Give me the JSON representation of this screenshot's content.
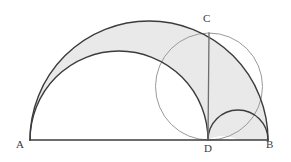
{
  "figure": {
    "name": "arbelos-construction",
    "canvas": {
      "width": 291,
      "height": 162
    },
    "background_color": "#ffffff"
  },
  "colors": {
    "stroke_dark": "#3c3c3c",
    "stroke_light": "#9a9a9a",
    "shade_fill": "#e9e9e9",
    "label_color": "#3a3a3a",
    "baseline": "#3c3c3c"
  },
  "labels": {
    "A": "A",
    "B": "B",
    "C": "C",
    "D": "D"
  },
  "points": {
    "A": {
      "x": 30,
      "y": 140
    },
    "B": {
      "x": 268,
      "y": 140
    },
    "C": {
      "x": 209,
      "y": 33
    },
    "D": {
      "x": 208,
      "y": 140
    }
  },
  "geometry": {
    "baseline": {
      "x1": 30,
      "y1": 140,
      "x2": 268,
      "y2": 140
    },
    "semicircle_AB": {
      "center_x": 149,
      "center_y": 140,
      "radius": 119,
      "from_x": 30,
      "to_x": 268
    },
    "semicircle_AD": {
      "center_x": 119,
      "center_y": 140,
      "radius": 89,
      "from_x": 30,
      "to_x": 208
    },
    "semicircle_DB": {
      "center_x": 238,
      "center_y": 140,
      "radius": 30,
      "from_x": 208,
      "to_x": 268
    },
    "circle_on_CD": {
      "center_x": 209,
      "center_y": 86.5,
      "radius": 53.5
    },
    "segment_CD": {
      "x1": 209,
      "y1": 33,
      "x2": 208,
      "y2": 140
    }
  },
  "shaded_region": {
    "name": "arbelos",
    "description": "Region bounded above by semicircle AB and below by semicircles AD and DB",
    "fill": "#e9e9e9"
  },
  "paths": {
    "arbelos_fill": "M 30 140 A 119 119 0 0 1 268 140 L 238 140 A 30 30 0 0 0 208 140 L 208 140 A 89 89 0 0 0 30 140 Z",
    "arc_AB": "M 30 140 A 119 119 0 0 1 268 140",
    "arc_AD": "M 30 140 A 89 89 0 0 1 208 140",
    "arc_DB": "M 208 140 A 30 30 0 0 1 268 140",
    "segment_CD": "M 209 33 L 208 140",
    "baseline": "M 30 140 L 268 140"
  }
}
